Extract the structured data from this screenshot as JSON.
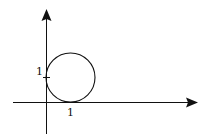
{
  "diagram": {
    "type": "coordinate-plot",
    "axes": {
      "x_axis": {
        "arrow": "right"
      },
      "y_axis": {
        "arrow": "up"
      }
    },
    "labels": {
      "y_tick": "1",
      "x_tick": "1"
    },
    "circle": {
      "center": [
        1,
        1
      ],
      "radius": 1
    },
    "colors": {
      "stroke": "#111111",
      "background": "#ffffff"
    }
  }
}
